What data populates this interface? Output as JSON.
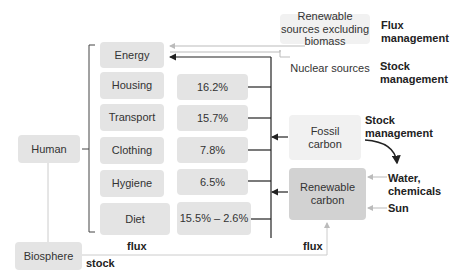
{
  "diagram": {
    "human": "Human",
    "biosphere": "Biosphere",
    "needs": [
      {
        "label": "Energy",
        "value": null
      },
      {
        "label": "Housing",
        "value": "16.2%"
      },
      {
        "label": "Transport",
        "value": "15.7%"
      },
      {
        "label": "Clothing",
        "value": "7.8%"
      },
      {
        "label": "Hygiene",
        "value": "6.5%"
      },
      {
        "label": "Diet",
        "value": "15.5% – 2.6%"
      }
    ],
    "sources": {
      "renewable_excl_biomass": "Renewable sources excluding biomass",
      "nuclear": "Nuclear sources",
      "fossil_carbon": "Fossil carbon",
      "renewable_carbon": "Renewable carbon"
    },
    "management": {
      "flux": "Flux management",
      "stock_nuclear": "Stock management",
      "stock_fossil": "Stock management"
    },
    "inputs": {
      "water": "Water, chemicals",
      "sun": "Sun"
    },
    "flow_labels": {
      "flux_left": "flux",
      "flux_right": "flux",
      "stock": "stock"
    },
    "colors": {
      "box": "#e4e4e4",
      "box_dark": "#d2d2d2",
      "box_light": "#f1f1f1",
      "line_dark": "#222222",
      "line_light": "#bbbbbb"
    }
  }
}
